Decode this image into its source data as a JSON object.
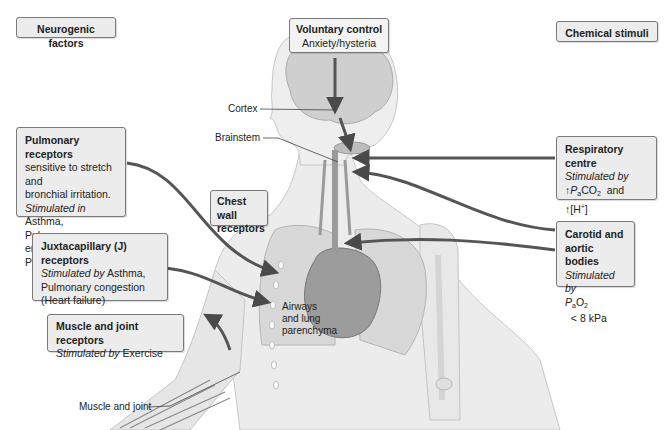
{
  "headers": {
    "neurogenic": "Neurogenic factors",
    "chemical": "Chemical stimuli"
  },
  "voluntary": {
    "title": "Voluntary control",
    "line1": "Anxiety/hysteria"
  },
  "pulmonary": {
    "title": "Pulmonary receptors",
    "line1": "sensitive to stretch and",
    "line2": "bronchial irritation.",
    "stim_prefix": "Stimulated in",
    "stim_rest": " Asthma,",
    "line4": "Pulmonary embolism,",
    "line5": "Pneumonia"
  },
  "chest_wall": {
    "title_line1": "Chest wall",
    "title_line2": "receptors"
  },
  "juxtacapillary": {
    "title": "Juxtacapillary (J) receptors",
    "stim_prefix": "Stimulated by",
    "stim_rest": " Asthma,",
    "line2": "Pulmonary congestion",
    "line3": "(Heart failure)"
  },
  "muscle_joint": {
    "title": "Muscle and joint receptors",
    "stim_prefix": "Stimulated by",
    "stim_rest": " Exercise"
  },
  "respiratory_centre": {
    "title": "Respiratory centre",
    "stim_prefix": "Stimulated by",
    "line2_arrow": "↑",
    "line2_p": "P",
    "line2_sub": "a",
    "line2_co": "CO",
    "line2_sub2": "2",
    "line2_and": "  and",
    "line3_arrow": "↑",
    "line3_text": "[H",
    "line3_sup": "+",
    "line3_close": "]"
  },
  "carotid": {
    "title_line1": "Carotid and",
    "title_line2": "aortic bodies",
    "stim_prefix": "Stimulated by",
    "line_p": "P",
    "line_sub": "a",
    "line_o": "O",
    "line_sub2": "2",
    "line_rest": "  < 8 kPa"
  },
  "labels": {
    "cortex": "Cortex",
    "brainstem": "Brainstem",
    "airways_line1": "Airways",
    "airways_line2": "and lung",
    "airways_line3": "parenchyma",
    "muscle_and_joint": "Muscle and joint"
  },
  "colors": {
    "box_fill": "#ececec",
    "box_border": "#7a7a7a",
    "arrow": "#555555",
    "body_fill": "#ebebeb",
    "organ_fill": "#9a9a9a"
  }
}
